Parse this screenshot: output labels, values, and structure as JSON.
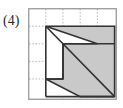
{
  "figure": {
    "label": "(4)",
    "panel": {
      "x": 28,
      "y": 8,
      "width": 89,
      "height": 92,
      "border_color": "#8f8f8f",
      "background_color": "#ffffff"
    },
    "grid": {
      "columns": 5,
      "rows": 5,
      "cell_width": 17.2,
      "cell_height": 17.6,
      "line_color": "#b9b9c6",
      "line_style": "dashed",
      "visible": true
    },
    "shape": {
      "name": "notched-square-with-diagonal",
      "fill_color": "#c9c9c9",
      "stroke_color": "#333333",
      "stroke_width": 1.6,
      "outer_square": {
        "origin_cell": [
          1,
          1
        ],
        "size_cells": [
          4,
          4
        ],
        "points_cells": [
          [
            1,
            1
          ],
          [
            5,
            1
          ],
          [
            5,
            5
          ],
          [
            1,
            5
          ]
        ]
      },
      "diagonal": {
        "from_cell": [
          1,
          1
        ],
        "to_cell": [
          5,
          5
        ],
        "description": "diagonal from top-left corner to bottom-right corner"
      },
      "white_notches": [
        {
          "name": "upper-left-notch",
          "points_cells": [
            [
              1,
              1
            ],
            [
              1,
              4
            ],
            [
              2,
              4
            ],
            [
              2,
              2
            ],
            [
              4,
              2
            ]
          ],
          "description": "white L-region left of the diagonal, upper portion"
        },
        {
          "name": "lower-left-notch",
          "points_cells": [
            [
              1,
              4
            ],
            [
              1,
              5
            ],
            [
              3,
              5
            ]
          ],
          "description": "white triangular region at bottom-left below the diagonal"
        }
      ],
      "shaded_regions": [
        {
          "name": "upper-band",
          "description": "shaded horizontal band across the top-right above the inner step"
        },
        {
          "name": "lower-triangle",
          "description": "large shaded triangle below and right of the diagonal"
        }
      ]
    }
  },
  "colors": {
    "shape_fill": "#c9c9c9",
    "shape_stroke": "#333333",
    "grid_line": "#b9b9c6",
    "panel_border": "#8f8f8f",
    "label_text": "#2b2b2b",
    "page_background": "#ffffff"
  }
}
